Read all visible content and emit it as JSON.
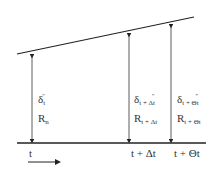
{
  "diagram": {
    "columns": [
      {
        "delta": "δ",
        "delta_sup": "″",
        "delta_sub": "t",
        "r": "R",
        "r_sub": "n",
        "axis_label": "t"
      },
      {
        "delta": "δ",
        "delta_sup": "″",
        "delta_sub": "t + Δt",
        "r": "R",
        "r_sub": "t + Δt",
        "axis_label": "t + Δt"
      },
      {
        "delta": "δ",
        "delta_sup": "″",
        "delta_sub": "t + Θt",
        "r": "R",
        "r_sub": "t + Θt",
        "axis_label": "t + Θt"
      }
    ],
    "time_arrow": "time-direction-arrow"
  }
}
